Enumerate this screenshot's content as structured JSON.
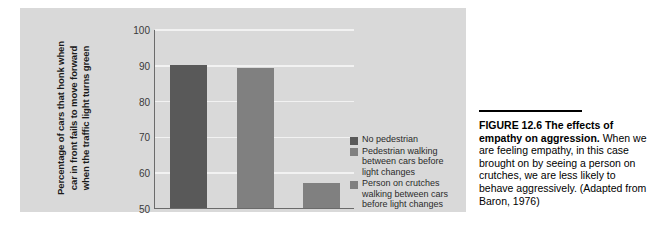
{
  "chart_data": {
    "type": "bar",
    "title": "",
    "xlabel": "",
    "ylabel": "Percentage of cars that honk when car in front fails to move forward when the traffic light turns green",
    "ylabel_lines": [
      "Percentage of cars that honk when",
      "car in front fails to move forward",
      "when the traffic light turns green"
    ],
    "ylim": [
      50,
      100
    ],
    "yticks": [
      50,
      60,
      70,
      80,
      90,
      100
    ],
    "ytick_labels": [
      "50",
      "60",
      "70",
      "80",
      "90",
      "100"
    ],
    "grid": true,
    "legend_position": "right",
    "categories": [
      "No pedestrian",
      "Pedestrian walking between cars before light changes",
      "Person on crutches walking between cars before light changes"
    ],
    "values": [
      90,
      89,
      57
    ],
    "colors": [
      "#595959",
      "#808080",
      "#808080"
    ]
  },
  "legend": {
    "items": [
      {
        "color": "#595959",
        "lines": [
          "No pedestrian"
        ]
      },
      {
        "color": "#808080",
        "lines": [
          "Pedestrian walking",
          "between cars before",
          "light changes"
        ]
      },
      {
        "color": "#808080",
        "lines": [
          "Person on crutches",
          "walking between cars",
          "before light changes"
        ]
      }
    ]
  },
  "caption": {
    "title": "FIGURE 12.6  The effects of empathy on aggression.",
    "body": " When we are feeling empathy, in this case brought on by seeing a person on crutches, we are less likely to behave aggressively. (Adapted from Baron, 1976)"
  },
  "colors": {
    "panel_background": "#d9d9d9",
    "axis_line": "#6b6b6b",
    "gridline": "#f2f2f2",
    "bar_dark": "#595959",
    "bar_light": "#808080",
    "caption_rule": "#000000"
  }
}
